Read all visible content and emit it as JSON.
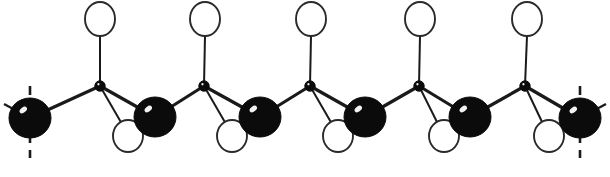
{
  "figure": {
    "caption": "",
    "background_color": "#ffffff",
    "width": 610,
    "height": 177
  },
  "palette": {
    "dark_atom": "#0b0b0b",
    "open_atom_fill": "#ffffff",
    "open_atom_stroke": "#2a2a2a",
    "bond": "#1a1a1a",
    "highlight": "#ffffff"
  },
  "legend": {
    "dark_atom_label": "",
    "open_atom_label": "",
    "vertex_label": ""
  },
  "chain": {
    "repeat_period_px": 104,
    "backbone_upper_y": 86,
    "backbone_lower_y": 118,
    "dark_atoms": [
      {
        "name": "backbone-dark-atom-1",
        "cx": 30,
        "cy": 118,
        "rx": 21,
        "ry": 20,
        "terminal": true
      },
      {
        "name": "backbone-dark-atom-2",
        "cx": 155,
        "cy": 117,
        "rx": 21,
        "ry": 20,
        "terminal": false
      },
      {
        "name": "backbone-dark-atom-3",
        "cx": 260,
        "cy": 117,
        "rx": 21,
        "ry": 20,
        "terminal": false
      },
      {
        "name": "backbone-dark-atom-4",
        "cx": 365,
        "cy": 117,
        "rx": 21,
        "ry": 20,
        "terminal": false
      },
      {
        "name": "backbone-dark-atom-5",
        "cx": 470,
        "cy": 117,
        "rx": 21,
        "ry": 20,
        "terminal": false
      },
      {
        "name": "backbone-dark-atom-6",
        "cx": 580,
        "cy": 118,
        "rx": 21,
        "ry": 20,
        "terminal": true
      }
    ],
    "vertex_atoms": [
      {
        "name": "backbone-vertex-atom-1",
        "cx": 100,
        "cy": 86,
        "r": 5.2
      },
      {
        "name": "backbone-vertex-atom-2",
        "cx": 204,
        "cy": 86,
        "r": 5.2
      },
      {
        "name": "backbone-vertex-atom-3",
        "cx": 310,
        "cy": 86,
        "r": 5.2
      },
      {
        "name": "backbone-vertex-atom-4",
        "cx": 419,
        "cy": 86,
        "r": 5.2
      },
      {
        "name": "backbone-vertex-atom-5",
        "cx": 525,
        "cy": 86,
        "r": 5.2
      }
    ],
    "top_open_atoms": [
      {
        "name": "substituent-open-atom-top-1",
        "cx": 100,
        "cy": 19,
        "rx": 15,
        "ry": 17
      },
      {
        "name": "substituent-open-atom-top-2",
        "cx": 205,
        "cy": 19,
        "rx": 15,
        "ry": 17
      },
      {
        "name": "substituent-open-atom-top-3",
        "cx": 311,
        "cy": 19,
        "rx": 15,
        "ry": 17
      },
      {
        "name": "substituent-open-atom-top-4",
        "cx": 420,
        "cy": 19,
        "rx": 15,
        "ry": 17
      },
      {
        "name": "substituent-open-atom-top-5",
        "cx": 527,
        "cy": 19,
        "rx": 15,
        "ry": 17
      }
    ],
    "bottom_open_atoms": [
      {
        "name": "substituent-open-atom-bottom-1",
        "cx": 128,
        "cy": 136,
        "rx": 15,
        "ry": 16
      },
      {
        "name": "substituent-open-atom-bottom-2",
        "cx": 232,
        "cy": 136,
        "rx": 15,
        "ry": 16
      },
      {
        "name": "substituent-open-atom-bottom-3",
        "cx": 338,
        "cy": 136,
        "rx": 15,
        "ry": 16
      },
      {
        "name": "substituent-open-atom-bottom-4",
        "cx": 444,
        "cy": 136,
        "rx": 15,
        "ry": 16
      },
      {
        "name": "substituent-open-atom-bottom-5",
        "cx": 549,
        "cy": 136,
        "rx": 15,
        "ry": 16
      }
    ],
    "backbone_bonds": [
      {
        "name": "backbone-bond-1",
        "x1": 30,
        "y1": 118,
        "x2": 100,
        "y2": 86
      },
      {
        "name": "backbone-bond-2",
        "x1": 100,
        "y1": 86,
        "x2": 155,
        "y2": 117
      },
      {
        "name": "backbone-bond-3",
        "x1": 155,
        "y1": 117,
        "x2": 204,
        "y2": 86
      },
      {
        "name": "backbone-bond-4",
        "x1": 204,
        "y1": 86,
        "x2": 260,
        "y2": 117
      },
      {
        "name": "backbone-bond-5",
        "x1": 260,
        "y1": 117,
        "x2": 310,
        "y2": 86
      },
      {
        "name": "backbone-bond-6",
        "x1": 310,
        "y1": 86,
        "x2": 365,
        "y2": 117
      },
      {
        "name": "backbone-bond-7",
        "x1": 365,
        "y1": 117,
        "x2": 419,
        "y2": 86
      },
      {
        "name": "backbone-bond-8",
        "x1": 419,
        "y1": 86,
        "x2": 470,
        "y2": 117
      },
      {
        "name": "backbone-bond-9",
        "x1": 470,
        "y1": 117,
        "x2": 525,
        "y2": 86
      },
      {
        "name": "backbone-bond-10",
        "x1": 525,
        "y1": 86,
        "x2": 580,
        "y2": 118
      }
    ],
    "substituent_bonds_top": [
      {
        "name": "substituent-bond-top-1",
        "x1": 100,
        "y1": 86,
        "x2": 100,
        "y2": 36
      },
      {
        "name": "substituent-bond-top-2",
        "x1": 204,
        "y1": 86,
        "x2": 205,
        "y2": 36
      },
      {
        "name": "substituent-bond-top-3",
        "x1": 310,
        "y1": 86,
        "x2": 311,
        "y2": 36
      },
      {
        "name": "substituent-bond-top-4",
        "x1": 419,
        "y1": 86,
        "x2": 420,
        "y2": 36
      },
      {
        "name": "substituent-bond-top-5",
        "x1": 525,
        "y1": 86,
        "x2": 527,
        "y2": 36
      }
    ],
    "substituent_bonds_bottom": [
      {
        "name": "substituent-bond-bottom-1",
        "x1": 100,
        "y1": 86,
        "x2": 122,
        "y2": 124
      },
      {
        "name": "substituent-bond-bottom-2",
        "x1": 204,
        "y1": 86,
        "x2": 226,
        "y2": 124
      },
      {
        "name": "substituent-bond-bottom-3",
        "x1": 310,
        "y1": 86,
        "x2": 332,
        "y2": 124
      },
      {
        "name": "substituent-bond-bottom-4",
        "x1": 419,
        "y1": 86,
        "x2": 438,
        "y2": 124
      },
      {
        "name": "substituent-bond-bottom-5",
        "x1": 525,
        "y1": 86,
        "x2": 543,
        "y2": 124
      }
    ],
    "terminal_stubs": [
      {
        "name": "terminal-bond-stub-left",
        "x1": 30,
        "y1": 118,
        "x2": 4,
        "y2": 104
      },
      {
        "name": "terminal-bond-stub-right",
        "x1": 580,
        "y1": 118,
        "x2": 606,
        "y2": 104
      }
    ],
    "continuation_axes": [
      {
        "name": "continuation-dashed-line-left",
        "x": 30,
        "y1": 86,
        "y2": 158
      },
      {
        "name": "continuation-dashed-line-right",
        "x": 580,
        "y1": 86,
        "y2": 158
      }
    ]
  }
}
